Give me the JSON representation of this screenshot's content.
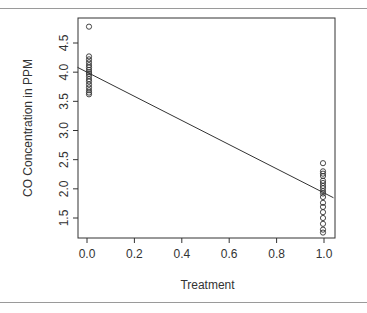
{
  "chart_data": {
    "type": "scatter",
    "title": "",
    "xlabel": "Treatment",
    "ylabel": "CO Concentration in PPM",
    "xlim": [
      -0.04,
      1.04
    ],
    "ylim": [
      1.2,
      4.85
    ],
    "x_ticks": [
      "0.0",
      "0.2",
      "0.4",
      "0.6",
      "0.8",
      "1.0"
    ],
    "y_ticks": [
      "1.5",
      "2.0",
      "2.5",
      "3.0",
      "3.5",
      "4.0",
      "4.5"
    ],
    "grid": false,
    "legend": null,
    "series": [
      {
        "name": "Treatment 0",
        "x": 0,
        "y": [
          4.78,
          4.27,
          4.22,
          4.17,
          4.12,
          4.08,
          4.04,
          4.0,
          3.97,
          3.93,
          3.88,
          3.84,
          3.79,
          3.74,
          3.69,
          3.65,
          3.62
        ]
      },
      {
        "name": "Treatment 1",
        "x": 1,
        "y": [
          2.44,
          2.3,
          2.26,
          2.22,
          2.14,
          2.1,
          2.05,
          2.01,
          1.96,
          1.92,
          1.86,
          1.76,
          1.69,
          1.6,
          1.5,
          1.4,
          1.3,
          1.25
        ]
      }
    ],
    "fit_line": {
      "type": "linear",
      "intercept": 4.0,
      "slope": -2.07
    }
  }
}
